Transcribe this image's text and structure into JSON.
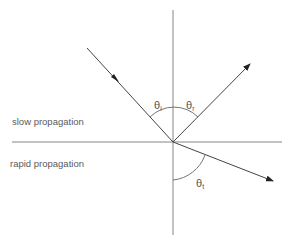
{
  "diagram": {
    "regions": {
      "upper_label": "slow propagation",
      "lower_label": "rapid propagation"
    },
    "angles": {
      "incident": {
        "symbol": "θ",
        "subscript": "i"
      },
      "reflected": {
        "symbol": "θ",
        "subscript": "r"
      },
      "transmitted": {
        "symbol": "θ",
        "subscript": "t"
      }
    },
    "rays": [
      "incident-ray",
      "reflected-ray",
      "transmitted-ray"
    ],
    "colors": {
      "line": "#555555",
      "ray": "#333333",
      "text": "#5a5a5a"
    }
  }
}
